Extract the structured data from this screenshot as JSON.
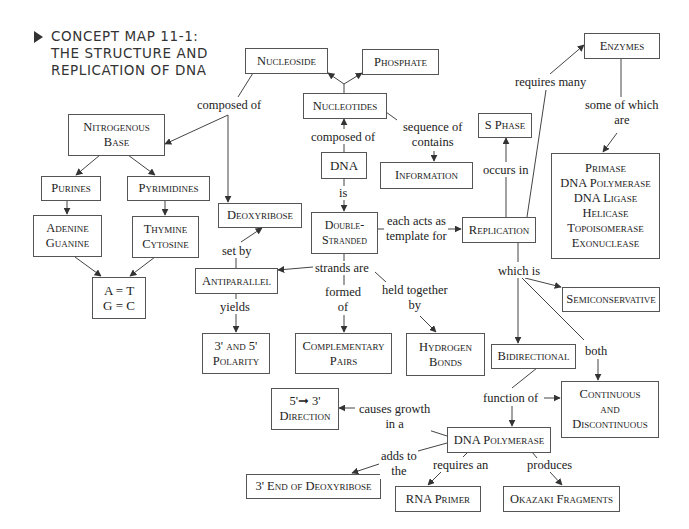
{
  "title": {
    "lines": [
      "CONCEPT MAP 11-1:",
      "THE STRUCTURE AND",
      "REPLICATION OF DNA"
    ]
  },
  "nodes": {
    "nucleoside": "Nucleoside",
    "phosphate": "Phosphate",
    "nucleotides": "Nucleotides",
    "nitrogenous_base": [
      "Nitrogenous",
      "Base"
    ],
    "dna": "DNA",
    "s_phase": "S Phase",
    "information": "Information",
    "enzymes": "Enzymes",
    "enzyme_list": [
      "Primase",
      "DNA Polymerase",
      "DNA Ligase",
      "Helicase",
      "Topoisomerase",
      "Exonuclease"
    ],
    "purines": "Purines",
    "pyrimidines": "Pyrimidines",
    "deoxyribose": "Deoxyribose",
    "double_stranded": [
      "Double-",
      "Stranded"
    ],
    "replication": "Replication",
    "adenine_guanine": [
      "Adenine",
      "Guanine"
    ],
    "thymine_cytosine": [
      "Thymine",
      "Cytosine"
    ],
    "base_pairs": [
      "A = T",
      "G = C"
    ],
    "antiparallel": "Antiparallel",
    "semiconservative": "Semiconservative",
    "polarity": [
      "3' and 5'",
      "Polarity"
    ],
    "complementary_pairs": [
      "Complementary",
      "Pairs"
    ],
    "hydrogen_bonds": [
      "Hydrogen",
      "Bonds"
    ],
    "bidirectional": "Bidirectional",
    "direction": [
      "5'➞ 3'",
      "Direction"
    ],
    "continuous_discontinuous": [
      "Continuous",
      "and",
      "Discontinuous"
    ],
    "dna_polymerase": "DNA Polymerase",
    "three_prime_end": "3' End of Deoxyribose",
    "rna_primer": "RNA Primer",
    "okazaki": "Okazaki Fragments"
  },
  "links": {
    "composed_of_1": "composed of",
    "composed_of_2": "composed of",
    "sequence_of": [
      "sequence of",
      "contains"
    ],
    "requires_many": "requires many",
    "some_of_which": [
      "some of which",
      "are"
    ],
    "occurs_in": "occurs in",
    "is": "is",
    "each_acts": [
      "each acts as",
      "template for"
    ],
    "set_by": "set by",
    "strands_are": "strands are",
    "yields": "yields",
    "formed_of": [
      "formed",
      "of"
    ],
    "held_together": [
      "held together",
      "by"
    ],
    "which_is": "which is",
    "both": "both",
    "function_of": "function of",
    "causes_growth": [
      "causes growth",
      "in a"
    ],
    "adds_to": [
      "adds to",
      "the"
    ],
    "requires_an": "requires an",
    "produces": "produces"
  },
  "colors": {
    "line": "#444444",
    "box_border": "#555555",
    "text": "#222222"
  }
}
